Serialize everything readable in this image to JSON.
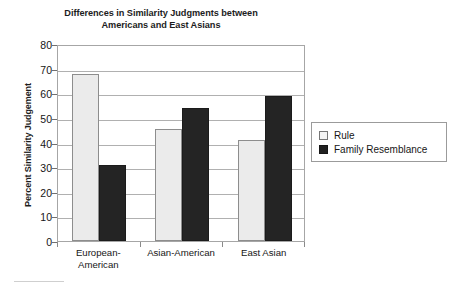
{
  "chart_data": {
    "type": "bar",
    "title": "Differences in Similarity Judgments between Americans and East Asians",
    "title_lines": [
      "Differences in Similarity Judgments between",
      "Americans and East Asians"
    ],
    "xlabel": "",
    "ylabel": "Percent Similarity Judgement",
    "ylim": [
      0,
      80
    ],
    "ytick_step": 10,
    "yticks": [
      0,
      10,
      20,
      30,
      40,
      50,
      60,
      70,
      80
    ],
    "ytick_labels": [
      "0",
      "10",
      "20",
      "30",
      "40",
      "50",
      "60",
      "70",
      "80"
    ],
    "grid": true,
    "grid_axis": "y",
    "legend_position": "right",
    "categories": [
      "European-American",
      "Asian-American",
      "East Asian"
    ],
    "category_label_lines": [
      [
        "European-",
        "American"
      ],
      [
        "Asian-American"
      ],
      [
        "East Asian"
      ]
    ],
    "series": [
      {
        "name": "Rule",
        "color": "#ebebeb",
        "edge_color": "#8d8d8d",
        "values": [
          68,
          45.5,
          41
        ]
      },
      {
        "name": "Family Resemblance",
        "color": "#242424",
        "edge_color": "#1b1b1b",
        "values": [
          31,
          54,
          59
        ]
      }
    ]
  },
  "legend": {
    "items": [
      {
        "label": "Rule",
        "swatch": "light"
      },
      {
        "label": "Family Resemblance",
        "swatch": "dark"
      }
    ]
  },
  "colors": {
    "background": "#ffffff",
    "axis": "#a6a6a6",
    "gridline": "#b0b0b0",
    "text": "#161616",
    "rule_fill": "#ebebeb",
    "family_resemblance_fill": "#242424"
  }
}
